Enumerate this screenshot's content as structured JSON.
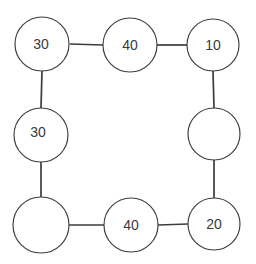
{
  "diagram": {
    "type": "cycle-graph",
    "background_color": "#ffffff",
    "node_fill_color": "#ffffff",
    "node_stroke_color": "#3c3c3c",
    "edge_color": "#3c3c3c",
    "label_color": "#3a3a3a",
    "node_count": 8,
    "edge_count": 8,
    "nodes": [
      {
        "id": "node-top-left",
        "label": "30",
        "cx": 42,
        "cy": 44,
        "r": 27,
        "label_dx": -1,
        "label_dy": 0
      },
      {
        "id": "node-top-middle",
        "label": "40",
        "cx": 130,
        "cy": 45,
        "r": 27,
        "label_dx": 0,
        "label_dy": 0
      },
      {
        "id": "node-top-right",
        "label": "10",
        "cx": 213,
        "cy": 45,
        "r": 26,
        "label_dx": 0,
        "label_dy": 0
      },
      {
        "id": "node-middle-right",
        "label": "",
        "cx": 214,
        "cy": 134,
        "r": 26,
        "label_dx": 0,
        "label_dy": 0
      },
      {
        "id": "node-bottom-right",
        "label": "20",
        "cx": 214,
        "cy": 224,
        "r": 26,
        "label_dx": 0,
        "label_dy": 0
      },
      {
        "id": "node-bottom-middle",
        "label": "40",
        "cx": 131,
        "cy": 225,
        "r": 27,
        "label_dx": 0,
        "label_dy": 0
      },
      {
        "id": "node-bottom-left",
        "label": "",
        "cx": 41,
        "cy": 225,
        "r": 28,
        "label_dx": 0,
        "label_dy": 0
      },
      {
        "id": "node-middle-left",
        "label": "30",
        "cx": 41,
        "cy": 135,
        "r": 27,
        "label_dx": -3,
        "label_dy": -3
      }
    ],
    "edges": [
      {
        "id": "edge-top-left-to-top-middle",
        "x1": 70,
        "y1": 44,
        "x2": 103,
        "y2": 45
      },
      {
        "id": "edge-top-middle-to-top-right",
        "x1": 157,
        "y1": 45,
        "x2": 187,
        "y2": 45
      },
      {
        "id": "edge-top-right-to-middle-right",
        "x1": 213,
        "y1": 71,
        "x2": 214,
        "y2": 108
      },
      {
        "id": "edge-middle-right-to-bottom-right",
        "x1": 214,
        "y1": 160,
        "x2": 214,
        "y2": 198
      },
      {
        "id": "edge-bottom-right-to-bottom-middle",
        "x1": 188,
        "y1": 224,
        "x2": 158,
        "y2": 225
      },
      {
        "id": "edge-bottom-middle-to-bottom-left",
        "x1": 104,
        "y1": 225,
        "x2": 69,
        "y2": 225
      },
      {
        "id": "edge-bottom-left-to-middle-left",
        "x1": 41,
        "y1": 197,
        "x2": 41,
        "y2": 162
      },
      {
        "id": "edge-middle-left-to-top-left",
        "x1": 42,
        "y1": 71,
        "x2": 41,
        "y2": 108
      }
    ]
  }
}
